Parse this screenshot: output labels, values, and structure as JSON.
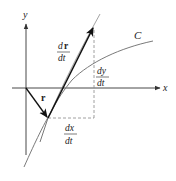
{
  "diagram": {
    "type": "vector-calculus-tangent",
    "colors": {
      "axis": "#333333",
      "curve": "#7a7a7a",
      "vector": "#111111",
      "dashed": "#888888",
      "text": "#222222"
    },
    "axes": {
      "x_label": "x",
      "y_label": "y"
    },
    "curve": {
      "label": "C"
    },
    "vectors": {
      "position": {
        "label": "r"
      },
      "derivative": {
        "numerator_d": "d",
        "numerator_r": "r",
        "denominator": "dt"
      }
    },
    "components": {
      "dx": {
        "numerator": "dx",
        "denominator": "dt"
      },
      "dy": {
        "numerator": "dy",
        "denominator": "dt"
      }
    }
  }
}
